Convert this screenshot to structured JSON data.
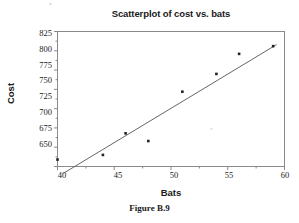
{
  "figure": {
    "caption": "Figure B.9"
  },
  "chart_data": {
    "type": "scatter",
    "title": "Scatterplot of cost vs. bats",
    "xlabel": "Bats",
    "ylabel": "Cost",
    "xlim": [
      40,
      60
    ],
    "ylim": [
      650,
      825
    ],
    "xticks": [
      40,
      45,
      50,
      55,
      60
    ],
    "yticks": [
      650,
      675,
      700,
      725,
      750,
      775,
      800,
      825
    ],
    "grid": false,
    "legend": null,
    "x": [
      40,
      44,
      46,
      48,
      51,
      54,
      56,
      59
    ],
    "y": [
      659,
      665,
      693,
      683,
      747,
      770,
      796,
      806
    ],
    "series": [
      {
        "name": "cost vs. bats",
        "marker": "filled-square",
        "color": "#222222",
        "points": [
          {
            "x": 40,
            "y": 659
          },
          {
            "x": 44,
            "y": 665
          },
          {
            "x": 46,
            "y": 693
          },
          {
            "x": 48,
            "y": 683
          },
          {
            "x": 51,
            "y": 747
          },
          {
            "x": 54,
            "y": 770
          },
          {
            "x": 56,
            "y": 796
          },
          {
            "x": 59,
            "y": 806
          }
        ]
      }
    ],
    "trendline": {
      "type": "linear-fit",
      "color": "#555555",
      "x_start": 40.5,
      "y_start": 641,
      "x_end": 59.3,
      "y_end": 808
    },
    "axis_color": "#808080",
    "frame": true
  }
}
